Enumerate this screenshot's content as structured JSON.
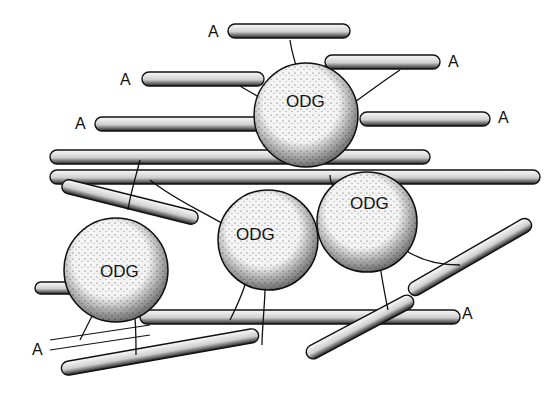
{
  "figure": {
    "type": "scientific illustration",
    "colors": {
      "ink": "#111111",
      "fiber_fill": "#e8e8e8",
      "cell_fill": "#f2f2f2",
      "background": "#ffffff"
    }
  },
  "labels": {
    "axons": [
      {
        "text": "A",
        "x": 208,
        "y": 24
      },
      {
        "text": "A",
        "x": 120,
        "y": 72
      },
      {
        "text": "A",
        "x": 75,
        "y": 116
      },
      {
        "text": "A",
        "x": 448,
        "y": 54
      },
      {
        "text": "A",
        "x": 498,
        "y": 110
      },
      {
        "text": "A",
        "x": 462,
        "y": 306
      },
      {
        "text": "A",
        "x": 32,
        "y": 342
      }
    ],
    "cells": [
      {
        "text": "ODG",
        "x": 286,
        "y": 93
      },
      {
        "text": "ODG",
        "x": 350,
        "y": 195
      },
      {
        "text": "ODG",
        "x": 236,
        "y": 226
      },
      {
        "text": "ODG",
        "x": 100,
        "y": 263
      }
    ]
  }
}
